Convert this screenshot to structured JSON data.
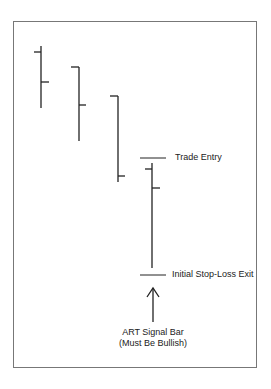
{
  "diagram": {
    "title": "",
    "annotations": {
      "trade_entry": "Trade Entry",
      "stop_loss": "Initial Stop-Loss Exit",
      "signal_bar_line1": "ART Signal Bar",
      "signal_bar_line2": "(Must Be Bullish)"
    },
    "bars": [
      {
        "x": 41,
        "high": 46,
        "low": 108,
        "open": 52,
        "close": 82
      },
      {
        "x": 79,
        "high": 67,
        "low": 141,
        "open": 67,
        "close": 105
      },
      {
        "x": 118,
        "high": 96,
        "low": 182,
        "open": 96,
        "close": 176
      },
      {
        "x": 152,
        "high": 163,
        "low": 268,
        "open": 169,
        "close": 188
      }
    ],
    "colors": {
      "line": "#222222",
      "frame": "#777777"
    }
  }
}
